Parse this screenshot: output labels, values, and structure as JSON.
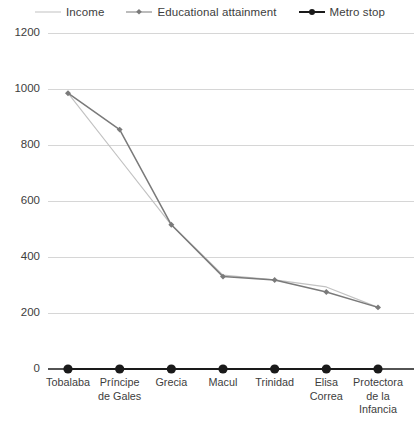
{
  "legend": {
    "items": [
      {
        "label": "Income",
        "color": "#c2c2c2",
        "marker": "none",
        "icon": "line-swatch-icon"
      },
      {
        "label": "Educational attainment",
        "color": "#7a7a7a",
        "marker": "diamond",
        "icon": "line-diamond-swatch-icon"
      },
      {
        "label": "Metro stop",
        "color": "#1a1a1a",
        "marker": "circle",
        "icon": "line-circle-swatch-icon"
      }
    ]
  },
  "axes": {
    "y_ticks": [
      "0",
      "200",
      "400",
      "600",
      "800",
      "1000",
      "1200"
    ],
    "x_labels": [
      "Tobalaba",
      "Príncipe\nde Gales",
      "Grecia",
      "Macul",
      "Trinidad",
      "Elisa\nCorrea",
      "Protectora\nde la\nInfancia"
    ]
  },
  "colors": {
    "income": "#c2c2c2",
    "educational_attainment": "#7a7a7a",
    "metro_stop": "#1a1a1a",
    "gridline": "#d6d6d6",
    "text": "#3d3d3d",
    "background": "#ffffff"
  },
  "chart_data": {
    "type": "line",
    "title": "",
    "xlabel": "",
    "ylabel": "",
    "ylim": [
      0,
      1200
    ],
    "yticks": [
      0,
      200,
      400,
      600,
      800,
      1000,
      1200
    ],
    "grid": true,
    "legend_position": "top",
    "categories": [
      "Tobalaba",
      "Príncipe de Gales",
      "Grecia",
      "Macul",
      "Trinidad",
      "Elisa Correa",
      "Protectora de la Infancia"
    ],
    "series": [
      {
        "name": "Income",
        "color": "#c2c2c2",
        "marker": "none",
        "values": [
          985,
          750,
          515,
          335,
          318,
          293,
          220
        ]
      },
      {
        "name": "Educational attainment",
        "color": "#7a7a7a",
        "marker": "diamond",
        "values": [
          985,
          855,
          515,
          330,
          318,
          275,
          220
        ]
      },
      {
        "name": "Metro stop",
        "color": "#1a1a1a",
        "marker": "circle",
        "values": [
          0,
          0,
          0,
          0,
          0,
          0,
          0
        ]
      }
    ]
  }
}
